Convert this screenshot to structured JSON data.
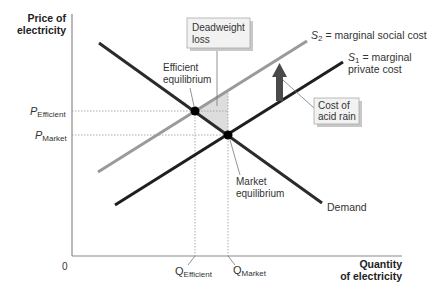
{
  "diagram": {
    "y_axis_label_line1": "Price of",
    "y_axis_label_line2": "electricity",
    "x_axis_label_line1": "Quantity",
    "x_axis_label_line2": "of electricity",
    "origin_label": "0",
    "price_labels": {
      "efficient_main": "P",
      "efficient_sub": "Efficient",
      "market_main": "P",
      "market_sub": "Market"
    },
    "quantity_labels": {
      "efficient_main": "Q",
      "efficient_sub": "Efficient",
      "market_main": "Q",
      "market_sub": "Market"
    },
    "curves": {
      "s2_main": "S",
      "s2_sub": "2",
      "s2_rest": " = marginal social cost",
      "s1_main": "S",
      "s1_sub": "1",
      "s1_rest": " = marginal",
      "s1_line2": "private cost",
      "demand": "Demand"
    },
    "annotations": {
      "deadweight_line1": "Deadweight",
      "deadweight_line2": "loss",
      "efficient_eq_line1": "Efficient",
      "efficient_eq_line2": "equilibrium",
      "market_eq_line1": "Market",
      "market_eq_line2": "equilibrium",
      "cost_line1": "Cost of",
      "cost_line2": "acid rain"
    },
    "colors": {
      "demand": "#2b2b2b",
      "s1": "#1e1e1e",
      "s2": "#9a9a9a",
      "axis": "#8a8a8a",
      "deadweight_fill": "#d9d9d9",
      "box_fill": "#f2f2f2",
      "arrow": "#4a4a4a"
    }
  }
}
